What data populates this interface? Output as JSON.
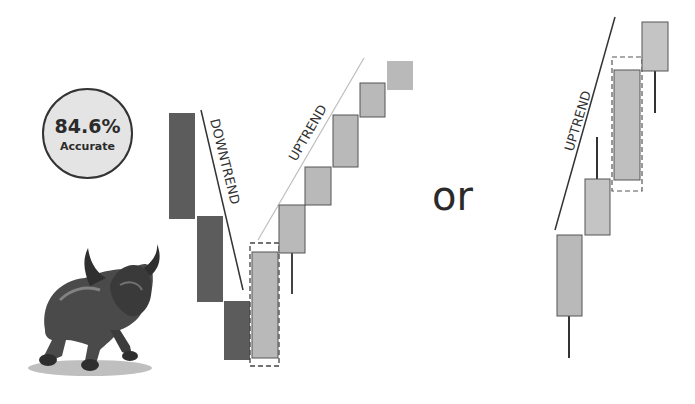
{
  "badge": {
    "percentage": "84.6%",
    "label": "Accurate"
  },
  "separator_text": "or",
  "left_pattern": {
    "downtrend_label": "DOWNTREND",
    "uptrend_label": "UPTREND",
    "bearish_candles": 3,
    "highlighted_candle": "bullish engulfing / reversal candle (dashed box)",
    "bullish_candles_after": 5
  },
  "right_pattern": {
    "uptrend_label": "UPTREND",
    "highlighted_candle": "large bullish candle (dashed box)",
    "candles": 4
  },
  "illustration": "bronze bull statue",
  "colors": {
    "bearish": "#5a5a5a",
    "bullish": "#b9b9b9",
    "outline": "#4a4a4a",
    "badge_fill": "#e4e4e4",
    "trendline_down": "#333333",
    "trendline_up_left": "#bdbdbd",
    "trendline_up_right": "#333333"
  }
}
